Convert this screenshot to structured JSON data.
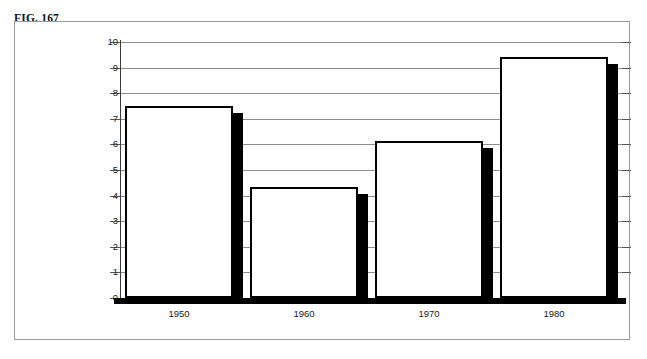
{
  "figure": {
    "label": "FIG. 167"
  },
  "chart_data": {
    "type": "bar",
    "title": "",
    "subtitle": "",
    "xlabel": "",
    "ylabel": "",
    "categories": [
      "1950",
      "1960",
      "1970",
      "1980"
    ],
    "values": [
      7.5,
      4.35,
      6.15,
      9.4
    ],
    "series": [
      {
        "name": "",
        "values": [
          7.5,
          4.35,
          6.15,
          9.4
        ]
      }
    ],
    "ylim": [
      0,
      10
    ],
    "yticks": [
      "0",
      "1",
      "2",
      "3",
      "4",
      "5",
      "6",
      "7",
      "8",
      "9",
      "10"
    ],
    "ytick_values": [
      0,
      1,
      2,
      3,
      4,
      5,
      6,
      7,
      8,
      9,
      10
    ],
    "grid": true,
    "grid_axis": "y",
    "legend": false,
    "legend_position": "none",
    "bar_style": "white-fill-black-outline-drop-shadow",
    "colors": {
      "bar_fill": "#ffffff",
      "bar_outline": "#000000",
      "bar_shadow": "#000000",
      "gridline": "#8d8d8d",
      "axis": "#000000",
      "text": "#1a1a1a",
      "frame_border": "#9a9a9a"
    },
    "annotations": []
  }
}
